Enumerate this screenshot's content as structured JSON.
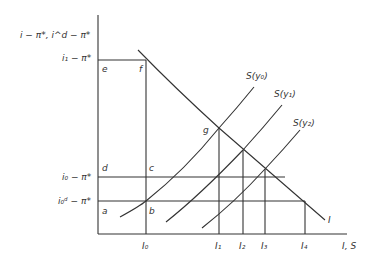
{
  "diagram": {
    "y_axis_label": "i − π*, i^d − π*",
    "x_axis_label": "I, S",
    "y_ticks": [
      {
        "id": "i1",
        "label": "i₁ − π*"
      },
      {
        "id": "i0",
        "label": "i₀ − π*"
      },
      {
        "id": "i0d",
        "label": "i₀ᵈ − π*"
      }
    ],
    "x_ticks": [
      "I₀",
      "I₁",
      "I₂",
      "I₃",
      "I₄"
    ],
    "points": [
      "a",
      "b",
      "c",
      "d",
      "e",
      "f",
      "g"
    ],
    "curves": {
      "investment": "I",
      "saving_0": "S(y₀)",
      "saving_1": "S(y₁)",
      "saving_2": "S(y₂)"
    }
  }
}
